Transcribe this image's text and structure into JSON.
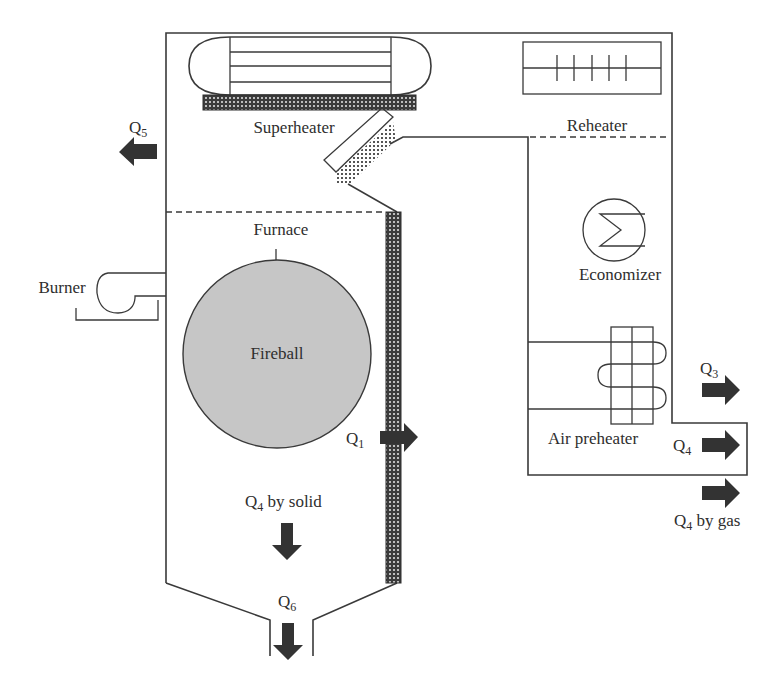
{
  "diagram": {
    "colors": {
      "line": "#3a3a3a",
      "arrow": "#333333",
      "fireball_fill": "#c6c6c6",
      "hatch_dark": "#3b3b3b",
      "hatch_light": "#bdbdbd"
    },
    "components": {
      "superheater": "Superheater",
      "reheater": "Reheater",
      "economizer": "Economizer",
      "furnace": "Furnace",
      "fireball": "Fireball",
      "burner": "Burner",
      "air_preheater": "Air preheater"
    },
    "heat_flows": {
      "q1": {
        "symbol": "Q",
        "sub": "1",
        "suffix": "",
        "direction": "right"
      },
      "q3": {
        "symbol": "Q",
        "sub": "3",
        "suffix": "",
        "direction": "right"
      },
      "q4_duct": {
        "symbol": "Q",
        "sub": "4",
        "suffix": "",
        "direction": "right"
      },
      "q4_gas": {
        "symbol": "Q",
        "sub": "4",
        "suffix": " by gas",
        "direction": "right"
      },
      "q4_solid": {
        "symbol": "Q",
        "sub": "4",
        "suffix": " by solid",
        "direction": "down"
      },
      "q5": {
        "symbol": "Q",
        "sub": "5",
        "suffix": "",
        "direction": "left"
      },
      "q6": {
        "symbol": "Q",
        "sub": "6",
        "suffix": "",
        "direction": "down"
      }
    }
  }
}
